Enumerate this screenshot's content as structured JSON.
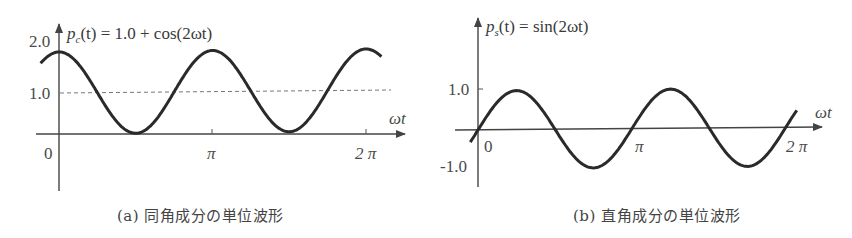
{
  "figures": [
    {
      "id": "a",
      "formula": "p_c(t) = 1.0 + cos(2ωt)",
      "formula_parts": {
        "p": "p",
        "sub": "c",
        "rest": "(t) = 1.0 + cos(2ωt)"
      },
      "y_ticks": [
        "2.0",
        "1.0",
        "0"
      ],
      "x_ticks": [
        "π",
        "2 π"
      ],
      "x_axis_label": "ωt",
      "caption": "(a) 同角成分の単位波形"
    },
    {
      "id": "b",
      "formula": "p_s(t) = sin(2ωt)",
      "formula_parts": {
        "p": "p",
        "sub": "s",
        "rest": "(t) = sin(2ωt)"
      },
      "y_ticks": [
        "1.0",
        "-1.0"
      ],
      "x_ticks": [
        "0",
        "π",
        "2 π"
      ],
      "x_axis_label": "ωt",
      "caption": "(b) 直角成分の単位波形"
    }
  ],
  "chart_data": [
    {
      "type": "line",
      "title": "p_c(t) = 1.0 + cos(2ωt)",
      "xlabel": "ωt",
      "ylabel": "p_c(t)",
      "x_ticks": [
        "0",
        "π",
        "2π"
      ],
      "y_ticks": [
        "0",
        "1.0",
        "2.0"
      ],
      "xlim": [
        -0.12,
        2.1
      ],
      "ylim": [
        -1.4,
        2.2
      ],
      "reference_line": {
        "y": 1.0,
        "style": "dashed"
      },
      "series": [
        {
          "name": "p_c(t)",
          "x": [
            -0.12,
            0,
            0.25,
            0.5,
            0.75,
            1.0,
            1.25,
            1.5,
            1.75,
            2.0,
            2.1
          ],
          "x_units": "π",
          "values": [
            1.73,
            2.0,
            1.0,
            0.0,
            1.0,
            2.0,
            1.0,
            0.0,
            1.0,
            2.0,
            1.81
          ]
        }
      ],
      "caption": "(a) 同角成分の単位波形",
      "grid": false,
      "legend": null
    },
    {
      "type": "line",
      "title": "p_s(t) = sin(2ωt)",
      "xlabel": "ωt",
      "ylabel": "p_s(t)",
      "x_ticks": [
        "0",
        "π",
        "2π"
      ],
      "y_ticks": [
        "-1.0",
        "1.0"
      ],
      "xlim": [
        -0.05,
        2.1
      ],
      "ylim": [
        -1.5,
        2.8
      ],
      "series": [
        {
          "name": "p_s(t)",
          "x": [
            -0.05,
            0,
            0.25,
            0.5,
            0.75,
            1.0,
            1.25,
            1.5,
            1.75,
            2.0,
            2.07
          ],
          "x_units": "π",
          "values": [
            -0.31,
            0.0,
            1.0,
            0.0,
            -1.0,
            0.0,
            1.0,
            0.0,
            -1.0,
            0.0,
            0.43
          ]
        }
      ],
      "caption": "(b) 直角成分の単位波形",
      "grid": false,
      "legend": null
    }
  ]
}
